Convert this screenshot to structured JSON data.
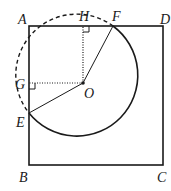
{
  "diagram": {
    "labels": {
      "A": "A",
      "B": "B",
      "C": "C",
      "D": "D",
      "E": "E",
      "F": "F",
      "G": "G",
      "H": "H",
      "O": "O"
    },
    "points": {
      "A": [
        29,
        26
      ],
      "B": [
        29,
        165
      ],
      "C": [
        163,
        165
      ],
      "D": [
        163,
        26
      ],
      "O": [
        83,
        83
      ],
      "H": [
        83,
        26
      ],
      "G": [
        29,
        83
      ],
      "E": [
        29,
        113
      ],
      "F": [
        113,
        26
      ]
    },
    "circle": {
      "center": "O",
      "radius": 61
    },
    "segments": {
      "solid": [
        "AB",
        "BC",
        "CD",
        "DA",
        "OE",
        "OF"
      ],
      "dotted": [
        "OH",
        "OG"
      ]
    },
    "arcs": {
      "solid": "E to F (major, through bottom/right)",
      "dashed": "F to E (through top-left, outside square)"
    },
    "right_angles": [
      "H",
      "G"
    ],
    "colors": {
      "stroke": "#1a1a1a",
      "background": "#ffffff"
    }
  }
}
